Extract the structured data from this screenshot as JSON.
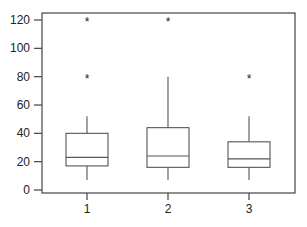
{
  "chart_data": {
    "type": "box",
    "title": "",
    "xlabel": "",
    "ylabel": "",
    "categories": [
      "1",
      "2",
      "3"
    ],
    "ylim": [
      0,
      120
    ],
    "yticks": [
      0,
      20,
      40,
      60,
      80,
      100,
      120
    ],
    "grid": false,
    "boxes": [
      {
        "category": "1",
        "whisker_low": 7,
        "q1": 17,
        "median": 23,
        "q3": 40,
        "whisker_high": 52,
        "outliers": [
          80,
          120
        ]
      },
      {
        "category": "2",
        "whisker_low": 7,
        "q1": 16,
        "median": 24,
        "q3": 44,
        "whisker_high": 80,
        "outliers": [
          120
        ]
      },
      {
        "category": "3",
        "whisker_low": 7,
        "q1": 16,
        "median": 22,
        "q3": 34,
        "whisker_high": 52,
        "outliers": [
          80
        ]
      }
    ],
    "outlier_marker": "*"
  },
  "style": {
    "line_color": "#555555",
    "axis_color": "#444444"
  }
}
